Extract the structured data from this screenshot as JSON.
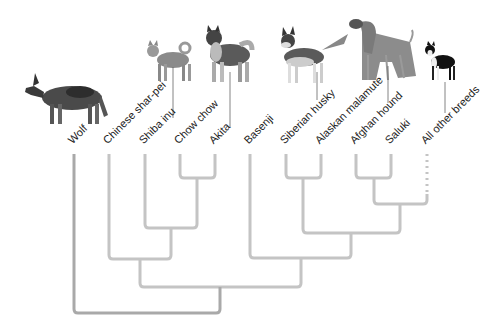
{
  "diagram": {
    "type": "cladogram",
    "colors": {
      "branch": "#c4c4c4",
      "root_branch": "#a9a9a9",
      "label": "#222222"
    },
    "leaves": [
      {
        "label": "Wolf",
        "x": 74,
        "has_image": true
      },
      {
        "label": "Chinese shar-pei",
        "x": 109,
        "has_image": false
      },
      {
        "label": "Shiba inu",
        "x": 145,
        "has_image": true
      },
      {
        "label": "Chow chow",
        "x": 180,
        "has_image": false
      },
      {
        "label": "Akita",
        "x": 215,
        "has_image": true
      },
      {
        "label": "Basenji",
        "x": 250,
        "has_image": false
      },
      {
        "label": "Siberian husky",
        "x": 286,
        "has_image": true
      },
      {
        "label": "Alaskan malamute",
        "x": 321,
        "has_image": false
      },
      {
        "label": "Afghan hound",
        "x": 356,
        "has_image": true
      },
      {
        "label": "Saluki",
        "x": 391,
        "has_image": false
      },
      {
        "label": "All other breeds",
        "x": 427,
        "has_image": true,
        "dotted_branch": true
      }
    ],
    "tree": "(Wolf,((Chinese shar-pei,(Shiba inu,(Chow chow,Akita))),(Basenji,((Siberian husky,Alaskan malamute),((Afghan hound,Saluki),All other breeds)))))",
    "images": [
      {
        "depicts": "wolf"
      },
      {
        "depicts": "shiba inu"
      },
      {
        "depicts": "akita"
      },
      {
        "depicts": "siberian husky"
      },
      {
        "depicts": "afghan hound"
      },
      {
        "depicts": "boston terrier (all other breeds)"
      }
    ]
  },
  "labels": {
    "wolf": "Wolf",
    "sharpei": "Chinese shar-pei",
    "shiba": "Shiba inu",
    "chow": "Chow chow",
    "akita": "Akita",
    "basenji": "Basenji",
    "husky": "Siberian husky",
    "malamute": "Alaskan malamute",
    "afghan": "Afghan hound",
    "saluki": "Saluki",
    "other": "All other breeds"
  }
}
